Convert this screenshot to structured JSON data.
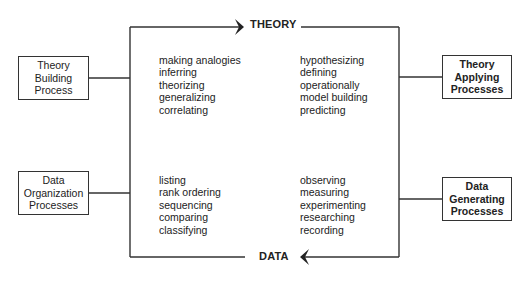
{
  "diagram": {
    "top_label": "THEORY",
    "bottom_label": "DATA",
    "boxes": {
      "theory_building": [
        "Theory",
        "Building",
        "Process"
      ],
      "data_organization": [
        "Data",
        "Organization",
        "Processes"
      ],
      "theory_applying": [
        "Theory",
        "Applying",
        "Processes"
      ],
      "data_generating": [
        "Data",
        "Generating",
        "Processes"
      ]
    },
    "lists": {
      "top_left": [
        "making analogies",
        "inferring",
        "theorizing",
        "generalizing",
        "correlating"
      ],
      "top_right": [
        "hypothesizing",
        "defining",
        "operationally",
        "model building",
        "predicting"
      ],
      "bottom_left": [
        "listing",
        "rank ordering",
        "sequencing",
        "comparing",
        "classifying"
      ],
      "bottom_right": [
        "observing",
        "measuring",
        "experimenting",
        "researching",
        "recording"
      ]
    },
    "colors": {
      "line": "#333333",
      "text": "#222222",
      "background": "#ffffff"
    }
  }
}
